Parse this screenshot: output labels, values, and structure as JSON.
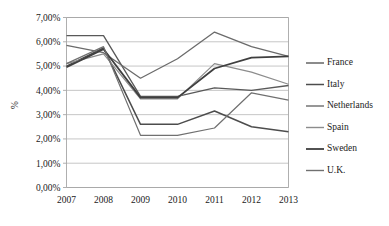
{
  "chart_data": {
    "type": "line",
    "title": "",
    "xlabel": "",
    "ylabel": "%",
    "categories": [
      "2007",
      "2008",
      "2009",
      "2010",
      "2011",
      "2012",
      "2013"
    ],
    "x": [
      2007,
      2008,
      2009,
      2010,
      2011,
      2012,
      2013
    ],
    "ylim": [
      0,
      7
    ],
    "ytick_labels": [
      "0,00%",
      "1,00%",
      "2,00%",
      "3,00%",
      "4,00%",
      "5,00%",
      "6,00%",
      "7,00%"
    ],
    "ytick_values": [
      0,
      1,
      2,
      3,
      4,
      5,
      6,
      7
    ],
    "grid": true,
    "legend_position": "right",
    "series": [
      {
        "name": "France",
        "color": "#595959",
        "width": 1.3,
        "values": [
          6.25,
          6.25,
          3.75,
          3.75,
          4.1,
          4.0,
          4.2
        ]
      },
      {
        "name": "Italy",
        "color": "#4d4d4d",
        "width": 1.5,
        "values": [
          5.0,
          5.75,
          2.6,
          2.6,
          3.15,
          2.5,
          2.3
        ]
      },
      {
        "name": "Netherlands",
        "color": "#6b6b6b",
        "width": 1.3,
        "values": [
          5.85,
          5.55,
          4.5,
          5.3,
          6.4,
          5.8,
          5.4
        ]
      },
      {
        "name": "Spain",
        "color": "#8c8c8c",
        "width": 1.2,
        "values": [
          5.1,
          5.5,
          3.65,
          3.65,
          5.1,
          4.75,
          4.25
        ]
      },
      {
        "name": "Sweden",
        "color": "#3f3f3f",
        "width": 1.8,
        "values": [
          4.95,
          5.7,
          3.7,
          3.7,
          4.9,
          5.35,
          5.4
        ]
      },
      {
        "name": "U.K.",
        "color": "#707070",
        "width": 1.2,
        "values": [
          5.1,
          5.8,
          2.15,
          2.15,
          2.45,
          3.9,
          3.6
        ]
      }
    ]
  },
  "legend": {
    "items": [
      {
        "label": "France"
      },
      {
        "label": "Italy"
      },
      {
        "label": "Netherlands"
      },
      {
        "label": "Spain"
      },
      {
        "label": "Sweden"
      },
      {
        "label": "U.K."
      }
    ]
  }
}
